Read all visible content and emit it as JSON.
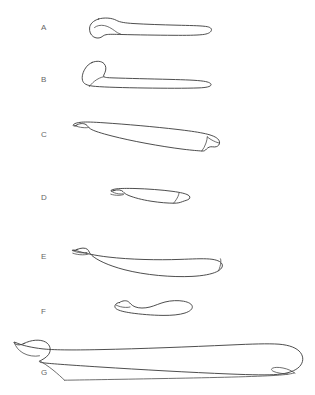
{
  "figure": {
    "background_color": "#ffffff",
    "stroke_color": "#3a3a3a",
    "label_color": "#666666",
    "width": 315,
    "height": 395,
    "caption": "",
    "title": ""
  },
  "panels": [
    {
      "id": "panel-a",
      "label": "A",
      "label_x": 41,
      "label_y": 24,
      "specimen": "elongate-bone-outline-a",
      "description": "Slender elongate element with expanded rounded proximal head at left and broad squared distal end at right",
      "bounds": {
        "x": 88,
        "y": 17,
        "width": 124,
        "height": 23
      }
    },
    {
      "id": "panel-b",
      "label": "B",
      "label_x": 41,
      "label_y": 76,
      "specimen": "elongate-bone-outline-b",
      "description": "Elongate element with hooked upturned proximal end at left and tapering flattened distal end at right",
      "bounds": {
        "x": 82,
        "y": 60,
        "width": 130,
        "height": 28
      }
    },
    {
      "id": "panel-c",
      "label": "C",
      "label_x": 41,
      "label_y": 131,
      "specimen": "elongate-bone-outline-c",
      "description": "Gently curved slender shaft with small notched proximal tip at left and angular expanded distal end at right",
      "bounds": {
        "x": 72,
        "y": 122,
        "width": 148,
        "height": 29
      }
    },
    {
      "id": "panel-d",
      "label": "D",
      "label_x": 41,
      "label_y": 194,
      "specimen": "elongate-bone-outline-d",
      "description": "Short element with small rounded proximal knob at left and blunt widened distal end at right",
      "bounds": {
        "x": 110,
        "y": 188,
        "width": 80,
        "height": 18
      }
    },
    {
      "id": "panel-e",
      "label": "E",
      "label_x": 41,
      "label_y": 253,
      "specimen": "elongate-bone-outline-e",
      "description": "Long bowed element, concave above, with small knobbed proximal end at left and rounded distal end at right",
      "bounds": {
        "x": 70,
        "y": 246,
        "width": 160,
        "height": 29
      }
    },
    {
      "id": "panel-f",
      "label": "F",
      "label_x": 41,
      "label_y": 308,
      "specimen": "elongate-bone-outline-f",
      "description": "Short sinuous element with rounded ends and a sigmoid waist",
      "bounds": {
        "x": 115,
        "y": 298,
        "width": 78,
        "height": 18
      }
    },
    {
      "id": "panel-g",
      "label": "G",
      "label_x": 41,
      "label_y": 369,
      "specimen": "elongate-bone-outline-g",
      "description": "Largest element spanning full plate width; expanded hooked proximal end at far left and massive bulbous distal end at far right with small notch",
      "bounds": {
        "x": 12,
        "y": 340,
        "width": 290,
        "height": 40
      }
    }
  ]
}
